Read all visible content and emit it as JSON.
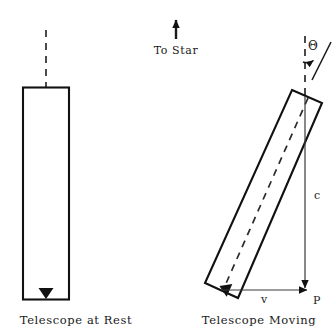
{
  "figure": {
    "title_top": "To Star",
    "panels": [
      {
        "id": "rest",
        "caption": "Telescope at Rest",
        "axis_style": "dashed",
        "arrow_direction": "down"
      },
      {
        "id": "moving",
        "caption": "Telescope Moving",
        "axis_style": "dashed",
        "arrow_direction": "down-left"
      }
    ],
    "annotations": {
      "angle_symbol": "Θ",
      "light_speed_label": "c",
      "velocity_label": "v",
      "point_label": "P"
    },
    "colors": {
      "ink": "#111111",
      "background": "#ffffff",
      "thin_ink": "#3a3a3a"
    }
  }
}
